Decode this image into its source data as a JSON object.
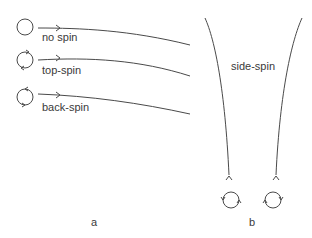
{
  "panel_a": {
    "label": "a",
    "trajectories": [
      {
        "name": "no spin",
        "label": "no spin",
        "spin_icon": "ball-no-spin"
      },
      {
        "name": "top-spin",
        "label": "top-spin",
        "spin_icon": "ball-top-spin"
      },
      {
        "name": "back-spin",
        "label": "back-spin",
        "spin_icon": "ball-back-spin"
      }
    ]
  },
  "panel_b": {
    "label": "b",
    "title": "side-spin",
    "balls": [
      {
        "name": "left-curving",
        "spin_icon": "ball-side-spin-left"
      },
      {
        "name": "right-curving",
        "spin_icon": "ball-side-spin-right"
      }
    ]
  },
  "colors": {
    "line": "#4a4a4a",
    "text": "#3a3a3a"
  }
}
